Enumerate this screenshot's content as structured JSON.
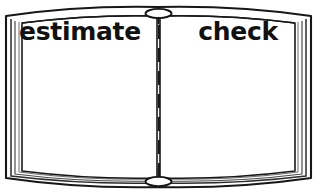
{
  "illustration": {
    "title": "open-book-two-column-worksheet",
    "subject": "open book with two blank facing pages",
    "background_color": "#ffffff",
    "ink_color": "#111111",
    "page_color": "#ffffff"
  },
  "book": {
    "left_page": {
      "heading": "estimate",
      "body_text": "",
      "body_placeholder": ""
    },
    "right_page": {
      "heading": "check",
      "body_text": "",
      "body_placeholder": ""
    },
    "spine": {
      "divider_style": "dashed",
      "divider_label": "center-fold",
      "dash_count": 7,
      "top_clasp_label": "top-binding-knot",
      "bottom_clasp_label": "bottom-binding-knot"
    },
    "cover": {
      "edge_line_count": 3,
      "outline_label": "book-cover-outline"
    }
  },
  "icons": {
    "book_icon": "open-book-icon",
    "fold_icon": "dashed-fold-line-icon",
    "clasp_icon": "binding-knot-icon"
  }
}
